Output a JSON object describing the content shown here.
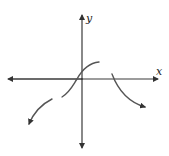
{
  "figure": {
    "axes": {
      "x_label": "x",
      "y_label": "y"
    },
    "curves": [
      {
        "name": "left-branch",
        "description": "decreasing to the lower-left with an arrow"
      },
      {
        "name": "middle-branch",
        "description": "S-shaped increasing curve through the origin area"
      },
      {
        "name": "right-branch",
        "description": "decreasing to the lower-right with an arrow, starting right of origin"
      }
    ],
    "colors": {
      "axis": "#3a3a3a",
      "curve": "#555555",
      "background": "#ffffff"
    }
  }
}
